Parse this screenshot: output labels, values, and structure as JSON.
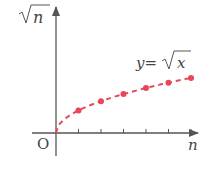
{
  "chart_data": {
    "type": "line",
    "title": "",
    "xlabel": "n",
    "ylabel": "√n",
    "origin_label": "O",
    "curve_label_lhs": "y=",
    "curve_label_rhs": "x",
    "curve_label_full": "y=√x",
    "series": [
      {
        "name": "y=√x",
        "style": "dashed",
        "color": "#e8475a",
        "x": [
          0,
          1,
          2,
          3,
          4,
          5,
          6
        ],
        "values": [
          0,
          1,
          1.414,
          1.732,
          2,
          2.236,
          2.449
        ]
      }
    ],
    "points": {
      "x": [
        1,
        2,
        3,
        4,
        5,
        6
      ],
      "values": [
        1,
        1.414,
        1.732,
        2,
        2.236,
        2.449
      ]
    },
    "x_ticks": [
      1,
      2,
      3,
      4,
      5,
      6
    ],
    "x_tick_labels": [],
    "grid": false,
    "legend": "none"
  },
  "colors": {
    "axis": "#555555",
    "curve": "#e8475a",
    "text": "#444444"
  }
}
